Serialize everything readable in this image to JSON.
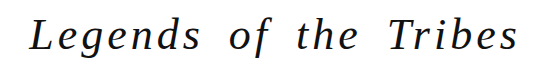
{
  "title": {
    "text": "Legends of the Tribes",
    "color": "#111111",
    "background": "#ffffff"
  }
}
